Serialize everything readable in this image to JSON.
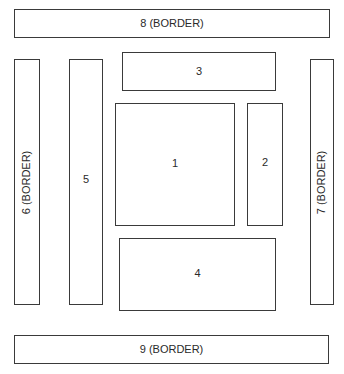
{
  "diagram": {
    "type": "layout-regions",
    "boxes": [
      {
        "id": "1",
        "label": "1"
      },
      {
        "id": "2",
        "label": "2"
      },
      {
        "id": "3",
        "label": "3"
      },
      {
        "id": "4",
        "label": "4"
      },
      {
        "id": "5",
        "label": "5"
      },
      {
        "id": "6",
        "label": "6 (BORDER)",
        "orientation": "vertical"
      },
      {
        "id": "7",
        "label": "7 (BORDER)",
        "orientation": "vertical"
      },
      {
        "id": "8",
        "label": "8 (BORDER)"
      },
      {
        "id": "9",
        "label": "9 (BORDER)"
      }
    ]
  }
}
